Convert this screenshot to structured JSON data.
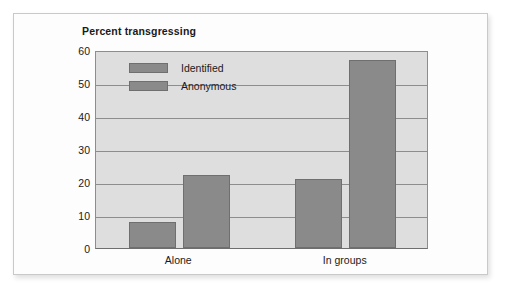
{
  "card": {
    "background_color": "#fdfdfd",
    "border_color": "#c9c9c9"
  },
  "chart_data": {
    "type": "bar",
    "title": "Percent transgressing",
    "xlabel": "",
    "ylabel": "",
    "categories": [
      "Alone",
      "In groups"
    ],
    "series": [
      {
        "name": "Identified",
        "values": [
          8,
          21
        ],
        "color": "#8a8a8a"
      },
      {
        "name": "Anonymous",
        "values": [
          22,
          57
        ],
        "color": "#8a8a8a"
      }
    ],
    "ylim": [
      0,
      60
    ],
    "yticks": [
      0,
      10,
      20,
      30,
      40,
      50,
      60
    ],
    "ytick_labels": [
      "0",
      "10",
      "20",
      "30",
      "40",
      "50",
      "60"
    ],
    "grid": true,
    "grid_color": "#8d8d8d",
    "plot_background": "#dedede",
    "legend_position": "upper-left-inside",
    "legend_entries": [
      "Identified",
      "Anonymous"
    ]
  }
}
